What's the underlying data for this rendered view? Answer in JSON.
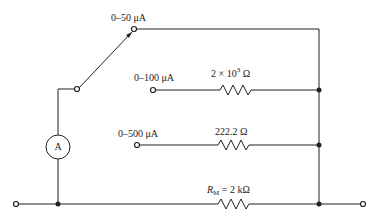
{
  "diagram": {
    "type": "multi-range ammeter circuit (Ayrton/shunt switch)",
    "switch_positions": [
      {
        "label": "0–50 μA",
        "note": "selected (switch contact)"
      },
      {
        "label": "0–100 μA"
      },
      {
        "label": "0–500 μA"
      }
    ],
    "resistors": [
      {
        "value_text": "2 × 10",
        "exp": "3",
        "unit": " Ω",
        "branch": "0–100 μA"
      },
      {
        "value_text": "222.2 Ω",
        "branch": "0–500 μA"
      },
      {
        "symbol": "R",
        "sub": "M",
        "value_text": " = 2 kΩ",
        "branch": "meter return"
      }
    ],
    "meter": {
      "symbol": "A"
    },
    "colors": {
      "line": "#222222",
      "background": "#ffffff"
    }
  }
}
